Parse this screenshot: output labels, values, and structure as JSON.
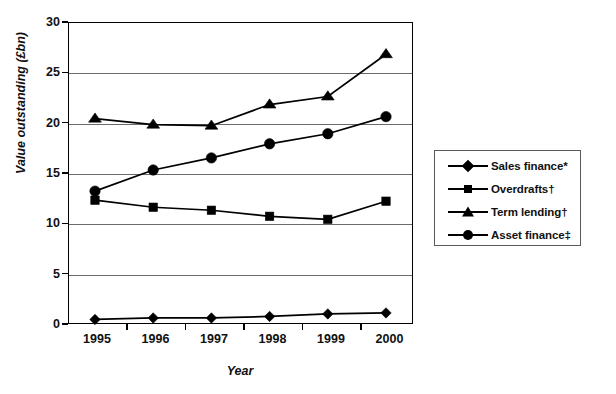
{
  "chart_data": {
    "type": "line",
    "title": "",
    "xlabel": "Year",
    "ylabel": "Value outstanding (£bn)",
    "categories": [
      "1995",
      "1996",
      "1997",
      "1998",
      "1999",
      "2000"
    ],
    "x": [
      1995,
      1996,
      1997,
      1998,
      1999,
      2000
    ],
    "ylim": [
      0,
      30
    ],
    "yticks": [
      0,
      5,
      10,
      15,
      20,
      25,
      30
    ],
    "ytick_labels": [
      "0",
      "5",
      "10",
      "15",
      "20",
      "25",
      "30"
    ],
    "grid": true,
    "legend_position": "right",
    "series": [
      {
        "name": "Sales finance*",
        "marker": "diamond",
        "values": [
          0.45,
          0.6,
          0.6,
          0.75,
          1.0,
          1.1
        ]
      },
      {
        "name": "Overdrafts†",
        "marker": "square",
        "values": [
          12.3,
          11.6,
          11.3,
          10.7,
          10.4,
          12.2
        ]
      },
      {
        "name": "Term lending†",
        "marker": "triangle",
        "values": [
          20.4,
          19.8,
          19.7,
          21.8,
          22.6,
          26.8
        ]
      },
      {
        "name": "Asset finance‡",
        "marker": "circle",
        "values": [
          13.2,
          15.3,
          16.5,
          17.9,
          18.9,
          20.6
        ]
      }
    ],
    "colors": {
      "line": "#000000",
      "marker": "#000000",
      "grid": "#6b6b6b",
      "frame": "#000000",
      "background": "#ffffff"
    }
  },
  "axes": {
    "y_title": "Value outstanding (£bn)",
    "x_title": "Year",
    "y_labels": [
      "30",
      "25",
      "20",
      "15",
      "10",
      "5",
      "0"
    ],
    "x_labels": [
      "1995",
      "1996",
      "1997",
      "1998",
      "1999",
      "2000"
    ]
  },
  "legend": {
    "entries": [
      {
        "label": "Sales finance*",
        "marker": "diamond-marker-icon"
      },
      {
        "label": "Overdrafts†",
        "marker": "square-marker-icon"
      },
      {
        "label": "Term lending†",
        "marker": "triangle-marker-icon"
      },
      {
        "label": "Asset finance‡",
        "marker": "circle-marker-icon"
      }
    ]
  }
}
